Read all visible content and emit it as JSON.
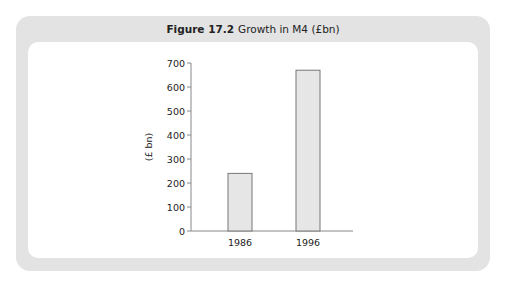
{
  "figure": {
    "number": "Figure 17.2",
    "caption": "Growth in M4 (£bn)"
  },
  "chart_data": {
    "type": "bar",
    "categories": [
      "1986",
      "1996"
    ],
    "values": [
      240,
      670
    ],
    "xlabel": "",
    "ylabel": "(£ bn)",
    "ylim": [
      0,
      700
    ],
    "yticks": [
      0,
      100,
      200,
      300,
      400,
      500,
      600,
      700
    ],
    "grid": false,
    "legend": null,
    "bar_color": "#e6e6e6",
    "bar_edge_color": "#777777"
  }
}
